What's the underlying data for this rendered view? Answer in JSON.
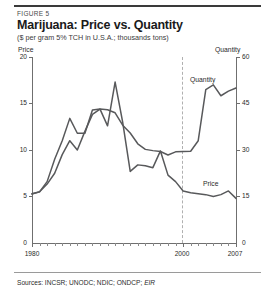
{
  "figure": {
    "label": "FIGURE 5",
    "title": "Marijuana: Price vs. Quantity",
    "subtitle": "($ per gram 5% TCH in U.S.A.; thousands tons)",
    "sources_prefix": "Sources: INCSR; UNODC; NDIC; ONDCP; ",
    "sources_italic": "EIR"
  },
  "axes": {
    "left_title": "Price",
    "right_title": "Quantity",
    "left_ticks": [
      "20",
      "15",
      "10",
      "5",
      "0"
    ],
    "right_ticks": [
      "60",
      "45",
      "30",
      "15",
      "0"
    ],
    "x_ticks": [
      "1980",
      "2000",
      "2007"
    ]
  },
  "series_labels": {
    "quantity": "Quantity",
    "price": "Price"
  },
  "colors": {
    "curve": "#58595b",
    "axis": "#6f6f6f",
    "marker": "#b0b0b0",
    "rule": "#3a3a3a",
    "text": "#231f20"
  },
  "chart_data": {
    "type": "line",
    "title": "Marijuana: Price vs. Quantity",
    "subtitle": "($ per gram 5% TCH in U.S.A.; thousands tons)",
    "xlabel": "",
    "ylabel": "Price",
    "y2label": "Quantity",
    "xlim": [
      1980,
      2007
    ],
    "ylim": [
      0,
      20
    ],
    "y2lim": [
      0,
      60
    ],
    "grid": false,
    "legend": "inline-annotations",
    "annotations": [
      {
        "text": "Quantity",
        "x": 2002,
        "series": "Quantity"
      },
      {
        "text": "Price",
        "x": 2004,
        "series": "Price"
      },
      {
        "text": "dashed vertical marker",
        "x": 2000
      }
    ],
    "x": [
      1980,
      1981,
      1982,
      1983,
      1984,
      1985,
      1986,
      1987,
      1988,
      1989,
      1990,
      1991,
      1992,
      1993,
      1994,
      1995,
      1996,
      1997,
      1998,
      1999,
      2000,
      2001,
      2002,
      2003,
      2004,
      2005,
      2006,
      2007
    ],
    "series": [
      {
        "name": "Price",
        "axis": "left",
        "unit": "$ per gram (5% TCH)",
        "values": [
          5.3,
          5.5,
          6.6,
          9.0,
          11.0,
          13.4,
          11.8,
          11.8,
          14.3,
          14.4,
          12.6,
          17.3,
          13.0,
          7.7,
          8.4,
          8.3,
          8.1,
          9.9,
          7.3,
          6.6,
          5.6,
          5.4,
          5.3,
          5.2,
          5.0,
          5.2,
          5.6,
          4.8
        ]
      },
      {
        "name": "Quantity",
        "axis": "right",
        "unit": "thousands tons",
        "values": [
          15.8,
          16.5,
          19.0,
          22.5,
          28.5,
          33.0,
          30.0,
          36.0,
          41.5,
          43.2,
          43.0,
          42.0,
          38.0,
          35.5,
          32.0,
          30.2,
          29.8,
          29.5,
          28.4,
          29.4,
          29.5,
          29.6,
          33.0,
          49.5,
          51.0,
          47.5,
          49.0,
          50.0
        ]
      }
    ]
  }
}
